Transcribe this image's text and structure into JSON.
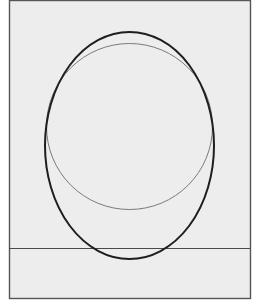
{
  "diagram": {
    "colors": {
      "page_background": "#ffffff",
      "frame_fill": "#ededed",
      "frame_stroke": "#555555",
      "ellipse_stroke": "#1e1e1e",
      "circle_stroke": "#7a7a7a",
      "line_stroke": "#4a4a4a"
    },
    "frame": {
      "x": 9,
      "y": 0,
      "width": 241,
      "height": 298
    },
    "ellipse": {
      "cx": 129.5,
      "cy": 145.5,
      "rx": 84.5,
      "ry": 113.5,
      "stroke_width": 2
    },
    "circle": {
      "cx": 129.5,
      "cy": 126.5,
      "r": 83,
      "stroke_width": 1
    },
    "horizontal_line": {
      "x1": 9,
      "x2": 250,
      "y": 248.5,
      "stroke_width": 1.2
    }
  }
}
